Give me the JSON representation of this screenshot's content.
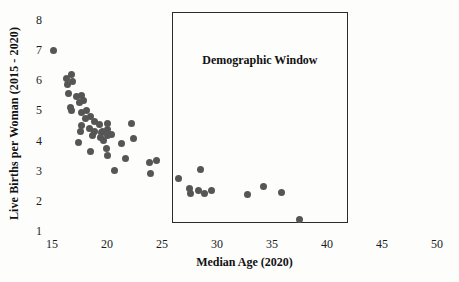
{
  "chart_data": {
    "type": "scatter",
    "title": "",
    "xlabel": "Median Age (2020)",
    "ylabel": "Live Births per Woman (2015 - 2020)",
    "x_ticks": [
      15,
      20,
      25,
      30,
      35,
      40,
      45,
      50
    ],
    "y_ticks": [
      1,
      2,
      3,
      4,
      5,
      6,
      7,
      8
    ],
    "xlim": [
      14,
      51
    ],
    "ylim": [
      0.9,
      8.3
    ],
    "grid": false,
    "legend": "none",
    "marker_color": "#565656",
    "annotation_box": {
      "label": "Demographic Window",
      "x0": 25.9,
      "x1": 41.9,
      "y0": 1.25,
      "y1": 8.25
    },
    "points": [
      [
        15.1,
        7.0
      ],
      [
        16.8,
        6.2
      ],
      [
        16.3,
        6.05
      ],
      [
        16.9,
        5.95
      ],
      [
        16.4,
        5.87
      ],
      [
        16.5,
        5.55
      ],
      [
        17.7,
        5.48
      ],
      [
        17.2,
        5.46
      ],
      [
        17.9,
        5.32
      ],
      [
        17.5,
        5.25
      ],
      [
        16.7,
        5.1
      ],
      [
        16.8,
        5.0
      ],
      [
        18.1,
        5.0
      ],
      [
        17.7,
        4.93
      ],
      [
        18.5,
        4.8
      ],
      [
        18.0,
        4.72
      ],
      [
        18.9,
        4.64
      ],
      [
        20.0,
        4.57
      ],
      [
        19.3,
        4.54
      ],
      [
        17.7,
        4.5
      ],
      [
        18.4,
        4.39
      ],
      [
        20.05,
        4.36
      ],
      [
        18.9,
        4.31
      ],
      [
        17.6,
        4.31
      ],
      [
        19.6,
        4.31
      ],
      [
        19.5,
        4.28
      ],
      [
        20.4,
        4.2
      ],
      [
        18.7,
        4.17
      ],
      [
        20.0,
        4.16
      ],
      [
        19.4,
        4.09
      ],
      [
        19.7,
        4.01
      ],
      [
        17.4,
        3.93
      ],
      [
        21.35,
        3.9
      ],
      [
        19.95,
        3.75
      ],
      [
        18.5,
        3.65
      ],
      [
        20.05,
        3.52
      ],
      [
        21.7,
        3.4
      ],
      [
        20.65,
        3.01
      ],
      [
        22.2,
        4.57
      ],
      [
        22.4,
        4.06
      ],
      [
        24.5,
        3.35
      ],
      [
        23.9,
        3.28
      ],
      [
        23.95,
        2.9
      ],
      [
        26.5,
        2.74
      ],
      [
        28.5,
        3.05
      ],
      [
        27.5,
        2.42
      ],
      [
        28.3,
        2.36
      ],
      [
        29.5,
        2.36
      ],
      [
        27.55,
        2.26
      ],
      [
        28.85,
        2.23
      ],
      [
        32.8,
        2.2
      ],
      [
        34.2,
        2.47
      ],
      [
        35.9,
        2.27
      ],
      [
        37.5,
        1.38
      ]
    ]
  }
}
